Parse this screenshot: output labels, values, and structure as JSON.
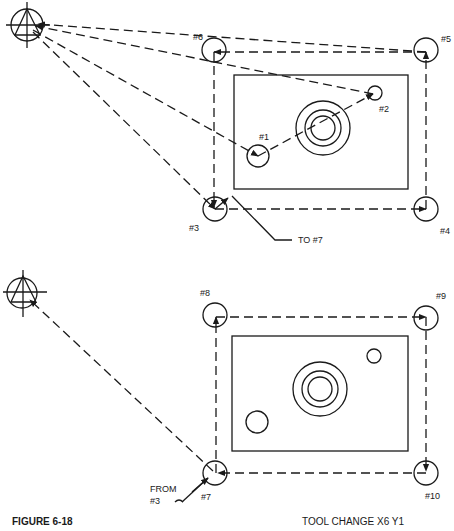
{
  "figure": {
    "caption": "FIGURE 6-18",
    "note": "TOOL CHANGE  X6 Y1"
  },
  "top_view": {
    "labels": {
      "p1": "#1",
      "p2": "#2",
      "p3": "#3",
      "p4": "#4",
      "p5": "#5",
      "p6": "#6",
      "leader": "TO #7"
    }
  },
  "bottom_view": {
    "labels": {
      "p7": "#7",
      "p8": "#8",
      "p9": "#9",
      "p10": "#10",
      "from_line1": "FROM",
      "from_line2": "#3"
    }
  },
  "colors": {
    "ink": "#1a1a1a",
    "paper": "#ffffff"
  }
}
